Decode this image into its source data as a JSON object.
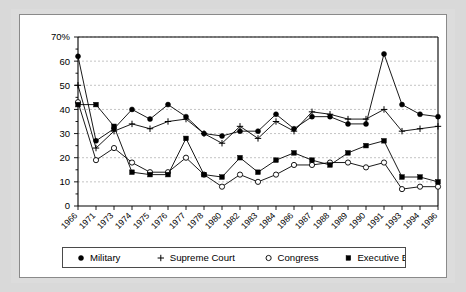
{
  "chart_data": {
    "type": "line",
    "title": "",
    "xlabel": "",
    "ylabel": "",
    "ylim": [
      0,
      70
    ],
    "yticks": [
      0,
      10,
      20,
      30,
      40,
      50,
      60,
      70
    ],
    "ytick_labels": [
      "0",
      "10",
      "20",
      "30",
      "40",
      "50",
      "60",
      "70%"
    ],
    "grid": true,
    "legend_position": "bottom",
    "categories": [
      "1966",
      "1971",
      "1973",
      "1974",
      "1975",
      "1976",
      "1977",
      "1978",
      "1980",
      "1982",
      "1983",
      "1984",
      "1986",
      "1987",
      "1988",
      "1989",
      "1990",
      "1991",
      "1993",
      "1994",
      "1996"
    ],
    "series": [
      {
        "name": "Military",
        "marker": "filled-circle",
        "values": [
          62,
          27,
          32,
          40,
          36,
          42,
          37,
          30,
          29,
          31,
          31,
          38,
          32,
          37,
          37,
          34,
          34,
          63,
          42,
          38,
          37
        ]
      },
      {
        "name": "Supreme Court",
        "marker": "plus",
        "values": [
          50,
          24,
          31,
          34,
          32,
          35,
          36,
          30,
          26,
          33,
          28,
          35,
          31,
          39,
          38,
          36,
          36,
          40,
          31,
          32,
          33
        ]
      },
      {
        "name": "Congress",
        "marker": "open-circle",
        "values": [
          43,
          19,
          24,
          18,
          14,
          14,
          20,
          13,
          8,
          13,
          10,
          13,
          17,
          17,
          18,
          18,
          16,
          18,
          7,
          8,
          8
        ]
      },
      {
        "name": "Executive Branch",
        "marker": "filled-square",
        "values": [
          42,
          42,
          33,
          14,
          13,
          13,
          28,
          13,
          12,
          20,
          14,
          19,
          22,
          19,
          17,
          22,
          25,
          27,
          12,
          12,
          10
        ]
      }
    ]
  },
  "legend": {
    "items": [
      {
        "label": "Military",
        "marker": "filled-circle"
      },
      {
        "label": "Supreme Court",
        "marker": "plus"
      },
      {
        "label": "Congress",
        "marker": "open-circle"
      },
      {
        "label": "Executive Branch",
        "marker": "filled-square"
      }
    ]
  }
}
